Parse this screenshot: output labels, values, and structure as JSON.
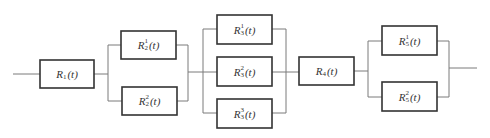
{
  "diagram": {
    "type": "reliability-block-diagram",
    "blocks": [
      {
        "id": "R1",
        "base": "R",
        "sup": "",
        "sub": "1",
        "arg": "(t)",
        "x": 40,
        "y": 60,
        "w": 54,
        "h": 28
      },
      {
        "id": "R2_1",
        "base": "R",
        "sup": "1",
        "sub": "2",
        "arg": "(t)",
        "x": 121,
        "y": 31,
        "w": 55,
        "h": 28
      },
      {
        "id": "R2_2",
        "base": "R",
        "sup": "2",
        "sub": "2",
        "arg": "(t)",
        "x": 122,
        "y": 87,
        "w": 55,
        "h": 28
      },
      {
        "id": "R3_1",
        "base": "R",
        "sup": "1",
        "sub": "3",
        "arg": "(t)",
        "x": 217,
        "y": 15,
        "w": 55,
        "h": 29
      },
      {
        "id": "R3_2",
        "base": "R",
        "sup": "2",
        "sub": "3",
        "arg": "(t)",
        "x": 217,
        "y": 57,
        "w": 55,
        "h": 29
      },
      {
        "id": "R3_3",
        "base": "R",
        "sup": "3",
        "sub": "3",
        "arg": "(t)",
        "x": 217,
        "y": 99,
        "w": 55,
        "h": 29
      },
      {
        "id": "R4",
        "base": "R",
        "sup": "",
        "sub": "4",
        "arg": "(t)",
        "x": 299,
        "y": 57,
        "w": 55,
        "h": 28
      },
      {
        "id": "R5_1",
        "base": "R",
        "sup": "1",
        "sub": "5",
        "arg": "(t)",
        "x": 382,
        "y": 26,
        "w": 55,
        "h": 29
      },
      {
        "id": "R5_2",
        "base": "R",
        "sup": "2",
        "sub": "5",
        "arg": "(t)",
        "x": 382,
        "y": 82,
        "w": 55,
        "h": 29
      }
    ],
    "colors": {
      "wire": "#7a7a7a",
      "box": "#333333",
      "text": "#333333"
    }
  }
}
